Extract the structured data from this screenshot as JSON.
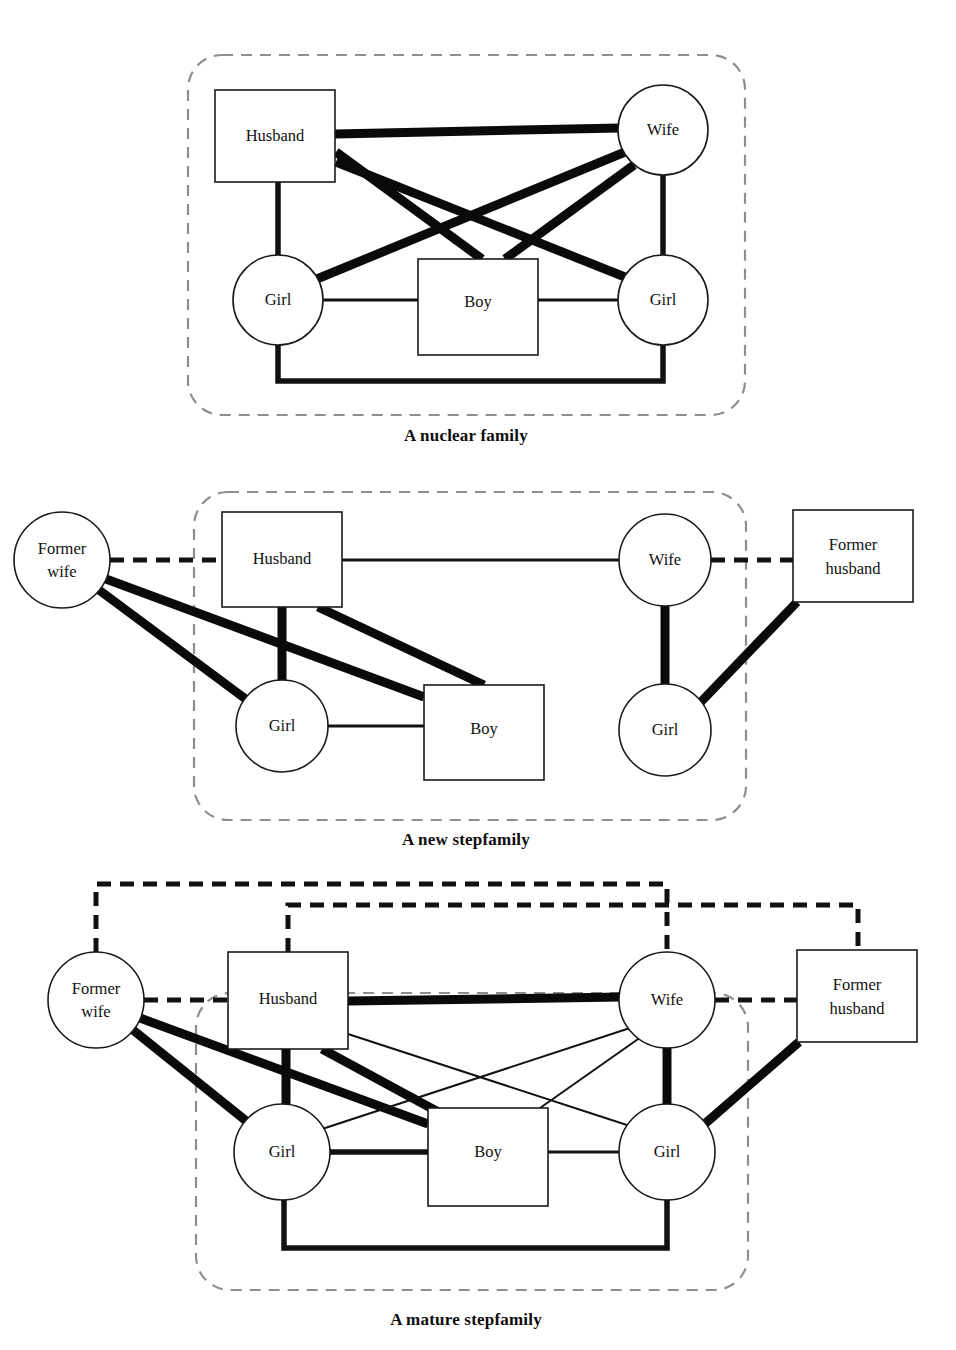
{
  "page": {
    "width": 956,
    "height": 1350,
    "background": "#ffffff",
    "ink_color": "#111111",
    "boundary_color": "#8e8e8e"
  },
  "legend": {
    "node_shapes": {
      "male": "square",
      "female": "circle"
    },
    "line_meanings": {
      "thin": "weak or distant bond",
      "medium": "moderate bond",
      "thick": "strong bond",
      "dashed_black": "former / severed marital tie",
      "dashed_gray_boundary": "household boundary"
    }
  },
  "diagrams": [
    {
      "id": "nuclear-family",
      "caption": "A nuclear family",
      "caption_pos": {
        "x": 466,
        "y": 441
      },
      "boundary": {
        "x": 188,
        "y": 55,
        "w": 557,
        "h": 360,
        "r": 34
      },
      "nodes": [
        {
          "id": "husband",
          "label": "Husband",
          "shape": "rect",
          "x": 215,
          "y": 90,
          "w": 120,
          "h": 92
        },
        {
          "id": "wife",
          "label": "Wife",
          "shape": "circle",
          "cx": 663,
          "cy": 130,
          "r": 45
        },
        {
          "id": "girl_left",
          "label": "Girl",
          "shape": "circle",
          "cx": 278,
          "cy": 300,
          "r": 45
        },
        {
          "id": "boy",
          "label": "Boy",
          "shape": "rect",
          "x": 418,
          "y": 259,
          "w": 120,
          "h": 96
        },
        {
          "id": "girl_right",
          "label": "Girl",
          "shape": "circle",
          "cx": 663,
          "cy": 300,
          "r": 45
        }
      ],
      "edges": [
        {
          "from": "husband",
          "to": "wife",
          "weight": "thick",
          "style": "solid"
        },
        {
          "from": "husband",
          "to": "girl_left",
          "weight": "med",
          "style": "solid"
        },
        {
          "from": "husband",
          "to": "boy",
          "weight": "thick",
          "style": "solid"
        },
        {
          "from": "husband",
          "to": "girl_right",
          "weight": "thick",
          "style": "solid"
        },
        {
          "from": "wife",
          "to": "girl_left",
          "weight": "thick",
          "style": "solid"
        },
        {
          "from": "wife",
          "to": "boy",
          "weight": "thick",
          "style": "solid"
        },
        {
          "from": "wife",
          "to": "girl_right",
          "weight": "med",
          "style": "solid"
        },
        {
          "from": "girl_left",
          "to": "boy",
          "weight": "thin",
          "style": "solid"
        },
        {
          "from": "boy",
          "to": "girl_right",
          "weight": "thin",
          "style": "solid"
        },
        {
          "from": "girl_left",
          "to": "girl_right",
          "weight": "med",
          "style": "solid-elbow-bottom"
        }
      ]
    },
    {
      "id": "new-stepfamily",
      "caption": "A new stepfamily",
      "caption_pos": {
        "x": 466,
        "y": 845
      },
      "boundary": {
        "x": 194,
        "y": 492,
        "w": 552,
        "h": 328,
        "r": 34
      },
      "nodes": [
        {
          "id": "former_wife",
          "label": "Former\nwife",
          "shape": "circle",
          "cx": 62,
          "cy": 560,
          "r": 48
        },
        {
          "id": "husband",
          "label": "Husband",
          "shape": "rect",
          "x": 222,
          "y": 512,
          "w": 120,
          "h": 95
        },
        {
          "id": "wife",
          "label": "Wife",
          "shape": "circle",
          "cx": 665,
          "cy": 560,
          "r": 46
        },
        {
          "id": "former_husband",
          "label": "Former\nhusband",
          "shape": "rect",
          "x": 793,
          "y": 510,
          "w": 120,
          "h": 92
        },
        {
          "id": "girl_left",
          "label": "Girl",
          "shape": "circle",
          "cx": 282,
          "cy": 726,
          "r": 46
        },
        {
          "id": "boy",
          "label": "Boy",
          "shape": "rect",
          "x": 424,
          "y": 685,
          "w": 120,
          "h": 95
        },
        {
          "id": "girl_right",
          "label": "Girl",
          "shape": "circle",
          "cx": 665,
          "cy": 730,
          "r": 46
        }
      ],
      "edges": [
        {
          "from": "former_wife",
          "to": "husband",
          "weight": "med",
          "style": "dashed-black"
        },
        {
          "from": "husband",
          "to": "wife",
          "weight": "thin",
          "style": "solid"
        },
        {
          "from": "wife",
          "to": "former_husband",
          "weight": "med",
          "style": "dashed-black"
        },
        {
          "from": "former_wife",
          "to": "girl_left",
          "weight": "thick",
          "style": "solid"
        },
        {
          "from": "former_wife",
          "to": "boy",
          "weight": "thick",
          "style": "solid"
        },
        {
          "from": "husband",
          "to": "girl_left",
          "weight": "thick",
          "style": "solid"
        },
        {
          "from": "husband",
          "to": "boy",
          "weight": "thick",
          "style": "solid"
        },
        {
          "from": "girl_left",
          "to": "boy",
          "weight": "thin",
          "style": "solid"
        },
        {
          "from": "wife",
          "to": "girl_right",
          "weight": "thick",
          "style": "solid"
        },
        {
          "from": "former_husband",
          "to": "girl_right",
          "weight": "thick",
          "style": "solid"
        }
      ]
    },
    {
      "id": "mature-stepfamily",
      "caption": "A mature stepfamily",
      "caption_pos": {
        "x": 466,
        "y": 1325
      },
      "boundary": {
        "x": 196,
        "y": 993,
        "w": 552,
        "h": 297,
        "r": 34
      },
      "bracket_lines": [
        {
          "id": "former-wife-to-wife",
          "from": "former_wife",
          "to": "wife",
          "top_y": 884
        },
        {
          "id": "husband-to-former-husband",
          "from": "husband",
          "to": "former_husband",
          "top_y": 905
        }
      ],
      "nodes": [
        {
          "id": "former_wife",
          "label": "Former\nwife",
          "shape": "circle",
          "cx": 96,
          "cy": 1000,
          "r": 48
        },
        {
          "id": "husband",
          "label": "Husband",
          "shape": "rect",
          "x": 228,
          "y": 952,
          "w": 120,
          "h": 97
        },
        {
          "id": "wife",
          "label": "Wife",
          "shape": "circle",
          "cx": 667,
          "cy": 1000,
          "r": 48
        },
        {
          "id": "former_husband",
          "label": "Former\nhusband",
          "shape": "rect",
          "x": 797,
          "y": 950,
          "w": 120,
          "h": 92
        },
        {
          "id": "girl_left",
          "label": "Girl",
          "shape": "circle",
          "cx": 282,
          "cy": 1152,
          "r": 48
        },
        {
          "id": "boy",
          "label": "Boy",
          "shape": "rect",
          "x": 428,
          "y": 1108,
          "w": 120,
          "h": 98
        },
        {
          "id": "girl_right",
          "label": "Girl",
          "shape": "circle",
          "cx": 667,
          "cy": 1152,
          "r": 48
        }
      ],
      "edges": [
        {
          "from": "former_wife",
          "to": "husband",
          "weight": "med",
          "style": "dashed-black"
        },
        {
          "from": "husband",
          "to": "wife",
          "weight": "thick",
          "style": "solid"
        },
        {
          "from": "wife",
          "to": "former_husband",
          "weight": "med",
          "style": "dashed-black"
        },
        {
          "from": "former_wife",
          "to": "girl_left",
          "weight": "thick",
          "style": "solid"
        },
        {
          "from": "former_wife",
          "to": "boy",
          "weight": "thick",
          "style": "solid"
        },
        {
          "from": "husband",
          "to": "girl_left",
          "weight": "thick",
          "style": "solid"
        },
        {
          "from": "husband",
          "to": "boy",
          "weight": "thick",
          "style": "solid"
        },
        {
          "from": "husband",
          "to": "girl_right",
          "weight": "hair",
          "style": "solid"
        },
        {
          "from": "wife",
          "to": "girl_left",
          "weight": "hair",
          "style": "solid"
        },
        {
          "from": "wife",
          "to": "boy",
          "weight": "hair",
          "style": "solid"
        },
        {
          "from": "wife",
          "to": "girl_right",
          "weight": "thick",
          "style": "solid"
        },
        {
          "from": "former_husband",
          "to": "girl_right",
          "weight": "thick",
          "style": "solid"
        },
        {
          "from": "girl_left",
          "to": "boy",
          "weight": "med",
          "style": "solid"
        },
        {
          "from": "boy",
          "to": "girl_right",
          "weight": "thin",
          "style": "solid"
        },
        {
          "from": "girl_left",
          "to": "girl_right",
          "weight": "med",
          "style": "solid-elbow-bottom"
        }
      ]
    }
  ]
}
